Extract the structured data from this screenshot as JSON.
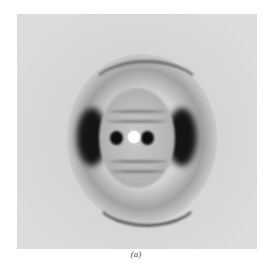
{
  "figure": {
    "caption": "(a)",
    "features": [
      "central bright spot",
      "two dark spots flanking center",
      "two dark lateral lobes",
      "upper arc",
      "lower arc",
      "layer-line stripes"
    ]
  }
}
